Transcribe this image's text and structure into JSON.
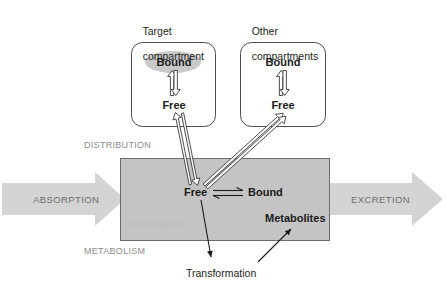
{
  "figure": {
    "title_visible": false,
    "colors": {
      "bloodstream_fill": "#c4c4c4",
      "bloodstream_stroke": "#6b6b6b",
      "flow_arrow_fill": "#d4d4d4",
      "bound_ellipse_fill": "#c9c9c9",
      "compartment_stroke": "#4d4d4d",
      "text_dark": "#231f20",
      "text_gray": "#8c8c8c",
      "bloodstream_text": "#bdbdbd"
    }
  },
  "compartments": [
    {
      "id": "target",
      "title_line1": "Target",
      "title_line2": "compartment",
      "bound_label": "Bound",
      "free_label": "Free",
      "has_bound_highlight": true
    },
    {
      "id": "other",
      "title_line1": "Other",
      "title_line2": "compartments",
      "bound_label": "Bound",
      "free_label": "Free",
      "has_bound_highlight": false
    }
  ],
  "bloodstream": {
    "name": "Bloodstream",
    "free_label": "Free",
    "bound_label": "Bound",
    "metabolites_label": "Metabolites",
    "equilibrium_symbol": "equilibrium-double-harpoon"
  },
  "processes": {
    "absorption": "ABSORPTION",
    "excretion": "EXCRETION",
    "distribution": "DISTRIBUTION",
    "metabolism": "METABOLISM"
  },
  "transformation": {
    "label": "Transformation"
  }
}
